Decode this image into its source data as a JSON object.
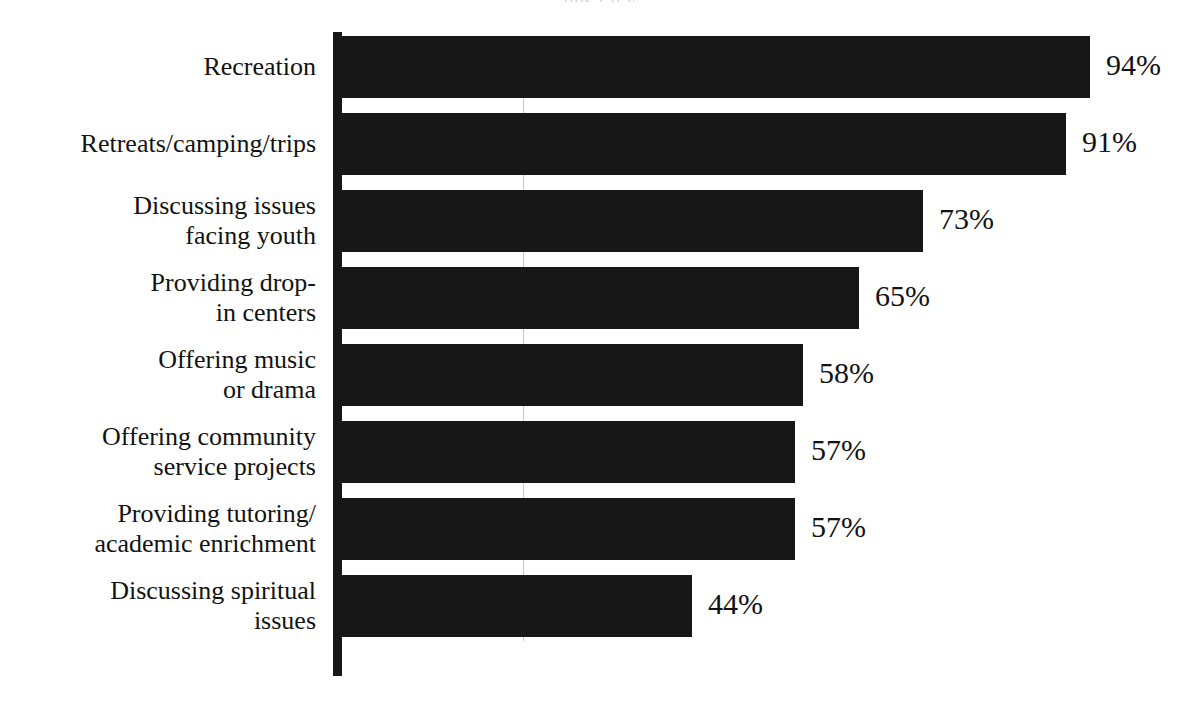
{
  "figure": {
    "title_remnant": "ngs t     h  y",
    "background_color": "#ffffff",
    "bar_color": "#171717",
    "text_color": "#121212",
    "axis_color": "#171717"
  },
  "chart_data": {
    "type": "bar",
    "orientation": "horizontal",
    "title": "",
    "subtitle": "",
    "xlabel": "",
    "ylabel": "",
    "xlim": [
      0,
      100
    ],
    "grid": false,
    "legend": null,
    "value_suffix": "%",
    "categories": [
      "Recreation",
      "Retreats/camping/trips",
      "Discussing issues\nfacing youth",
      "Providing drop-\nin centers",
      "Offering music\nor drama",
      "Offering community\nservice projects",
      "Providing tutoring/\nacademic enrichment",
      "Discussing spiritual\nissues"
    ],
    "values": [
      94,
      91,
      73,
      65,
      58,
      57,
      57,
      44
    ],
    "value_labels": [
      "94%",
      "91%",
      "73%",
      "65%",
      "58%",
      "57%",
      "57%",
      "44%"
    ],
    "bars": [
      {
        "category": "Recreation",
        "label_lines": 1,
        "value": 94,
        "value_label": "94%"
      },
      {
        "category": "Retreats/camping/trips",
        "label_lines": 1,
        "value": 91,
        "value_label": "91%"
      },
      {
        "category": "Discussing issues\nfacing youth",
        "label_lines": 2,
        "value": 73,
        "value_label": "73%"
      },
      {
        "category": "Providing drop-\nin centers",
        "label_lines": 2,
        "value": 65,
        "value_label": "65%"
      },
      {
        "category": "Offering music\nor drama",
        "label_lines": 2,
        "value": 58,
        "value_label": "58%"
      },
      {
        "category": "Offering community\nservice projects",
        "label_lines": 2,
        "value": 57,
        "value_label": "57%"
      },
      {
        "category": "Providing tutoring/\nacademic enrichment",
        "label_lines": 2,
        "value": 57,
        "value_label": "57%"
      },
      {
        "category": "Discussing spiritual\nissues",
        "label_lines": 2,
        "value": 44,
        "value_label": "44%"
      }
    ]
  }
}
